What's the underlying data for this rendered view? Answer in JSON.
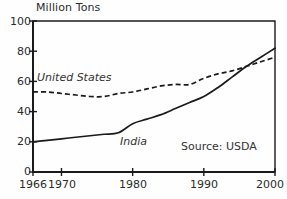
{
  "chart_data": {
    "type": "line",
    "title": "",
    "ylabel": "Million Tons",
    "xlabel": "",
    "ylim": [
      0,
      100
    ],
    "xlim": [
      1966,
      2000
    ],
    "yticks": [
      0,
      20,
      40,
      60,
      80,
      100
    ],
    "xticks": [
      1966,
      1970,
      1980,
      1990,
      2000
    ],
    "grid": false,
    "legend_position": "inline-labels",
    "annotations": [
      "Source: USDA"
    ],
    "series": [
      {
        "name": "United States",
        "style": "dashed",
        "color": "#1a1a1a",
        "x": [
          1966,
          1968,
          1970,
          1972,
          1974,
          1976,
          1978,
          1980,
          1982,
          1984,
          1986,
          1988,
          1990,
          1992,
          1994,
          1996,
          1998,
          2000
        ],
        "values": [
          53,
          53,
          52,
          51,
          50,
          50,
          52,
          53,
          55,
          57,
          58,
          58,
          62,
          65,
          67,
          70,
          73,
          76
        ]
      },
      {
        "name": "India",
        "style": "solid",
        "color": "#1a1a1a",
        "x": [
          1966,
          1968,
          1970,
          1972,
          1974,
          1976,
          1978,
          1980,
          1982,
          1984,
          1986,
          1988,
          1990,
          1992,
          1994,
          1996,
          1998,
          2000
        ],
        "values": [
          20,
          21,
          22,
          23,
          24,
          25,
          26,
          32,
          35,
          38,
          42,
          46,
          50,
          56,
          63,
          70,
          76,
          82
        ]
      }
    ]
  },
  "axes": {
    "y_title": "Million Tons",
    "y_tick_labels": [
      "100",
      "80",
      "60",
      "40",
      "20",
      "0"
    ],
    "x_tick_labels": [
      "1966",
      "1970",
      "1980",
      "1990",
      "2000"
    ]
  },
  "labels": {
    "united_states": "United States",
    "india": "India",
    "source": "Source: USDA"
  },
  "colors": {
    "line": "#1a1a1a",
    "axis": "#1a1a1a",
    "text": "#2b2b2b",
    "background": "#fefefe"
  }
}
